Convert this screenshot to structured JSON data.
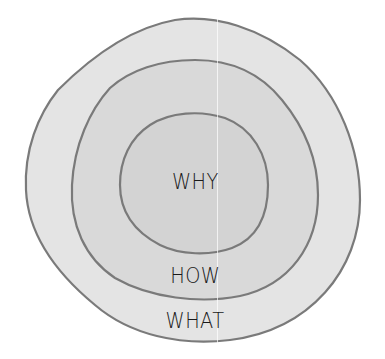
{
  "diagram": {
    "type": "golden-circle",
    "rings": [
      {
        "id": "what",
        "label": "WHAT",
        "fill": "#e4e4e4",
        "stroke": "#7a7a7a"
      },
      {
        "id": "how",
        "label": "HOW",
        "fill": "#d9d9d9",
        "stroke": "#7a7a7a"
      },
      {
        "id": "why",
        "label": "WHY",
        "fill": "#d3d3d3",
        "stroke": "#7a7a7a"
      }
    ],
    "labels": {
      "why": "WHY",
      "how": "HOW",
      "what": "WHAT"
    },
    "colors": {
      "background": "#ffffff",
      "outer_fill": "#e4e4e4",
      "middle_fill": "#d9d9d9",
      "inner_fill": "#d3d3d3",
      "stroke": "#7a7a7a",
      "text": "#1a1a1a"
    }
  }
}
